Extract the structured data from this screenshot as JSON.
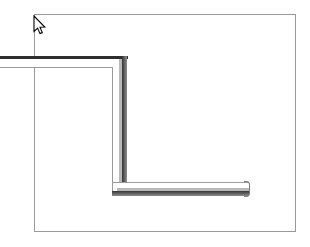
{
  "app": {
    "title": "CAD Drawing Canvas",
    "canvas_background": "#ffffff"
  },
  "canvas": {
    "label": "drawing-canvas",
    "width": 310,
    "height": 247
  },
  "frame": {
    "label": "drawing-frame",
    "stroke_color": "#9a9a9a",
    "x": 34,
    "y": 14,
    "width": 262,
    "height": 218
  },
  "shape": {
    "label": "L-shaped member",
    "type": "polyline-extrusion",
    "line_color_dark": "#2e2e2e",
    "line_color_light": "#9b9b9b",
    "shade_color": "#5d5d5d",
    "fill_color": "#ffffff",
    "segments": [
      {
        "name": "upper-horizontal-member",
        "orientation": "horizontal",
        "x1": 0,
        "y1": 56,
        "x2": 128,
        "y2": 68,
        "thickness": 12
      },
      {
        "name": "vertical-member",
        "orientation": "vertical",
        "x1": 112,
        "y1": 56,
        "x2": 127,
        "y2": 196,
        "thickness": 15
      },
      {
        "name": "lower-horizontal-member",
        "orientation": "horizontal",
        "x1": 112,
        "y1": 182,
        "x2": 249,
        "y2": 196,
        "thickness": 14
      }
    ]
  },
  "cursor": {
    "label": "arrow-pointer",
    "x": 33,
    "y": 15,
    "fill": "#ffffff",
    "stroke": "#000000"
  }
}
